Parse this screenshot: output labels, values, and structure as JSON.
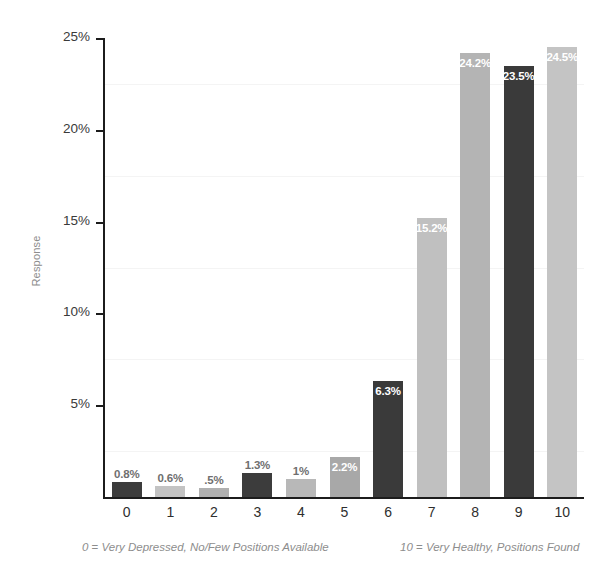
{
  "chart_data": {
    "type": "bar",
    "title": "",
    "subtitle": "",
    "xlabel": "",
    "ylabel": "Response",
    "categories": [
      "0",
      "1",
      "2",
      "3",
      "4",
      "5",
      "6",
      "7",
      "8",
      "9",
      "10"
    ],
    "values": [
      0.8,
      0.6,
      0.5,
      1.3,
      1.0,
      2.2,
      6.3,
      15.2,
      24.2,
      23.5,
      24.5
    ],
    "value_labels": [
      "0.8%",
      "0.6%",
      ".5%",
      "1.3%",
      "1%",
      "2.2%",
      "6.3%",
      "15.2%",
      "24.2%",
      "23.5%",
      "24.5%"
    ],
    "label_placement": [
      "outside",
      "outside",
      "outside",
      "outside",
      "outside",
      "inside",
      "inside",
      "inside",
      "inside",
      "inside",
      "inside"
    ],
    "bar_colors": [
      "#3c3c3c",
      "#c3c3c3",
      "#b0b0b0",
      "#3c3c3c",
      "#b8b8b8",
      "#a8a8a8",
      "#3a3a3a",
      "#c0c0c0",
      "#b4b4b4",
      "#3a3a3a",
      "#c4c4c4"
    ],
    "ylim": [
      0,
      25
    ],
    "ytick_values": [
      25,
      20,
      15,
      10,
      5
    ],
    "ytick_labels": [
      "25%",
      "20%",
      "15%",
      "10%",
      "5%"
    ],
    "gridline_values": [
      22.5,
      17.5,
      12.5,
      7.5,
      2.5
    ],
    "grid": true,
    "grid_color": "#f4f4f4",
    "legend": "none",
    "annotations": [
      "0 = Very Depressed, No/Few Positions Available",
      "10 = Very Healthy, Positions Found"
    ]
  },
  "footnotes": {
    "left_number": "0",
    "left_eq": "=",
    "left_text": "Very Depressed, No/Few Positions Available",
    "right_number": "10",
    "right_eq": "=",
    "right_text": "Very Healthy, Positions Found"
  }
}
